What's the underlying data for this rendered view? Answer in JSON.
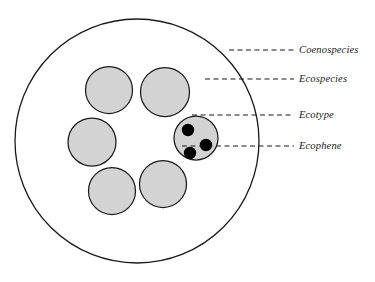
{
  "figure": {
    "kind": "nested-circle-taxonomy-diagram",
    "background_color": "#ffffff",
    "outline_color": "#1a1a1a",
    "fill_color": "#d3d3d3",
    "dot_color": "#000000",
    "leader_line_color": "#1a1a1a"
  },
  "outer_circle": {
    "name": "Coenospecies",
    "cx": 137,
    "cy": 141,
    "r": 122,
    "fill": "#ffffff",
    "stroke": "#1a1a1a",
    "stroke_width": 1.3
  },
  "inner_circles": [
    {
      "name": "Ecospecies",
      "cx": 109,
      "cy": 90,
      "r": 23.5,
      "fill": "#d3d3d3"
    },
    {
      "name": "Ecospecies",
      "cx": 165,
      "cy": 92,
      "r": 24.5,
      "fill": "#d3d3d3"
    },
    {
      "name": "Ecospecies",
      "cx": 92,
      "cy": 142,
      "r": 24,
      "fill": "#d3d3d3"
    },
    {
      "name": "Ecospecies",
      "cx": 112,
      "cy": 191,
      "r": 23.5,
      "fill": "#d3d3d3"
    },
    {
      "name": "Ecospecies",
      "cx": 163,
      "cy": 184,
      "r": 23.5,
      "fill": "#d3d3d3"
    },
    {
      "name": "Ecotype",
      "cx": 196,
      "cy": 138,
      "r": 22,
      "fill": "#d3d3d3"
    }
  ],
  "ecophene_dots": [
    {
      "name": "Ecophene",
      "cx": 188,
      "cy": 130,
      "r": 6.2,
      "fill": "#000000"
    },
    {
      "name": "Ecophene",
      "cx": 206,
      "cy": 145,
      "r": 6.2,
      "fill": "#000000"
    },
    {
      "name": "Ecophene",
      "cx": 190,
      "cy": 153,
      "r": 6.2,
      "fill": "#000000"
    }
  ],
  "leaders": [
    {
      "label": "Coenospecies",
      "x1": 229,
      "x2": 294,
      "y": 50,
      "label_x": 299,
      "label_y": 53
    },
    {
      "label": "Ecospecies",
      "x1": 205,
      "x2": 294,
      "y": 79,
      "label_x": 299,
      "label_y": 82
    },
    {
      "label": "Ecotype",
      "x1": 192,
      "x2": 294,
      "y": 115,
      "label_x": 299,
      "label_y": 118
    },
    {
      "label": "Ecophene",
      "x1": 182,
      "x2": 294,
      "y": 146,
      "label_x": 299,
      "label_y": 149
    }
  ],
  "labels": {
    "coenospecies": "Coenospecies",
    "ecospecies": "Ecospecies",
    "ecotype": "Ecotype",
    "ecophene": "Ecophene"
  }
}
